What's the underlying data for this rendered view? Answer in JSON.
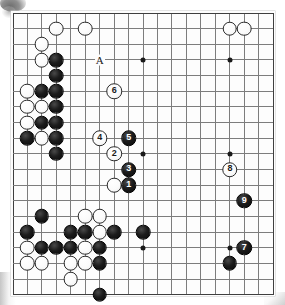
{
  "diagram": {
    "kind": "go-board-diagram",
    "board_size": 19,
    "colors": {
      "board_background": "#fdfdfd",
      "grid_line": "#7d7d7d",
      "grid_line_strong": "#3f3f3f",
      "black_stone": "#0a0a0a",
      "white_stone": "#ffffff",
      "black_number_text": "#ffffff",
      "white_number_text": "#1b1b1b",
      "marker_text": "#1a1a1a"
    },
    "markers": [
      {
        "label": "A",
        "col": 7,
        "row": 4,
        "name": "marker-a"
      }
    ],
    "hoshi_points": [
      {
        "col": 4,
        "row": 4
      },
      {
        "col": 10,
        "row": 4
      },
      {
        "col": 16,
        "row": 4
      },
      {
        "col": 4,
        "row": 10
      },
      {
        "col": 10,
        "row": 10
      },
      {
        "col": 16,
        "row": 10
      },
      {
        "col": 4,
        "row": 16
      },
      {
        "col": 10,
        "row": 16
      },
      {
        "col": 16,
        "row": 16
      }
    ],
    "numbered_stones": [
      {
        "num": "1",
        "color": "black",
        "col": 9,
        "row": 12
      },
      {
        "num": "2",
        "color": "white",
        "col": 8,
        "row": 10
      },
      {
        "num": "3",
        "color": "black",
        "col": 9,
        "row": 11
      },
      {
        "num": "4",
        "color": "white",
        "col": 7,
        "row": 9
      },
      {
        "num": "5",
        "color": "black",
        "col": 9,
        "row": 9
      },
      {
        "num": "6",
        "color": "white",
        "col": 8,
        "row": 6
      },
      {
        "num": "7",
        "color": "black",
        "col": 17,
        "row": 16
      },
      {
        "num": "8",
        "color": "white",
        "col": 16,
        "row": 11
      },
      {
        "num": "9",
        "color": "black",
        "col": 17,
        "row": 13
      }
    ],
    "black_stones": [
      {
        "col": 4,
        "row": 4
      },
      {
        "col": 4,
        "row": 5
      },
      {
        "col": 3,
        "row": 6
      },
      {
        "col": 4,
        "row": 6
      },
      {
        "col": 4,
        "row": 7
      },
      {
        "col": 3,
        "row": 8
      },
      {
        "col": 4,
        "row": 8
      },
      {
        "col": 2,
        "row": 9
      },
      {
        "col": 4,
        "row": 9
      },
      {
        "col": 4,
        "row": 10
      },
      {
        "col": 3,
        "row": 14
      },
      {
        "col": 2,
        "row": 15
      },
      {
        "col": 5,
        "row": 15
      },
      {
        "col": 6,
        "row": 15
      },
      {
        "col": 8,
        "row": 15
      },
      {
        "col": 10,
        "row": 15
      },
      {
        "col": 3,
        "row": 16
      },
      {
        "col": 4,
        "row": 16
      },
      {
        "col": 5,
        "row": 16
      },
      {
        "col": 7,
        "row": 16
      },
      {
        "col": 7,
        "row": 17
      },
      {
        "col": 7,
        "row": 19
      },
      {
        "col": 16,
        "row": 17
      }
    ],
    "white_stones": [
      {
        "col": 4,
        "row": 2
      },
      {
        "col": 6,
        "row": 2
      },
      {
        "col": 16,
        "row": 2
      },
      {
        "col": 17,
        "row": 2
      },
      {
        "col": 3,
        "row": 3
      },
      {
        "col": 3,
        "row": 4
      },
      {
        "col": 2,
        "row": 6
      },
      {
        "col": 2,
        "row": 7
      },
      {
        "col": 3,
        "row": 7
      },
      {
        "col": 2,
        "row": 8
      },
      {
        "col": 3,
        "row": 9
      },
      {
        "col": 8,
        "row": 12
      },
      {
        "col": 6,
        "row": 14
      },
      {
        "col": 7,
        "row": 14
      },
      {
        "col": 7,
        "row": 15
      },
      {
        "col": 2,
        "row": 16
      },
      {
        "col": 6,
        "row": 16
      },
      {
        "col": 2,
        "row": 17
      },
      {
        "col": 3,
        "row": 17
      },
      {
        "col": 5,
        "row": 17
      },
      {
        "col": 6,
        "row": 17
      },
      {
        "col": 5,
        "row": 18
      }
    ]
  }
}
